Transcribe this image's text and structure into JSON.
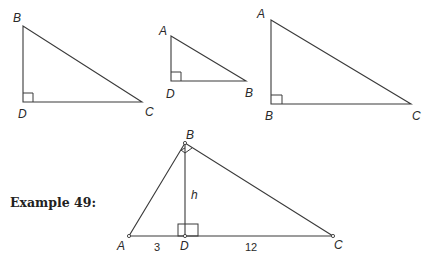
{
  "example": {
    "label": "Example 49:"
  },
  "triangles": [
    {
      "name": "triangle-BDC",
      "vertices": {
        "B": "B",
        "D": "D",
        "C": "C"
      },
      "right_angle_at": "D"
    },
    {
      "name": "triangle-ADB",
      "vertices": {
        "A": "A",
        "D": "D",
        "B": "B"
      },
      "right_angle_at": "D"
    },
    {
      "name": "triangle-ABC",
      "vertices": {
        "A": "A",
        "B": "B",
        "C": "C"
      },
      "right_angle_at": "B"
    }
  ],
  "main_figure": {
    "vertices": {
      "A": "A",
      "B": "B",
      "C": "C",
      "D": "D"
    },
    "altitude_label": "h",
    "segment_AD": "3",
    "segment_DC": "12",
    "right_angles": [
      "B",
      "D"
    ]
  },
  "colors": {
    "stroke": "#3a3a3a",
    "text": "#2a2a2a",
    "background": "#ffffff"
  }
}
